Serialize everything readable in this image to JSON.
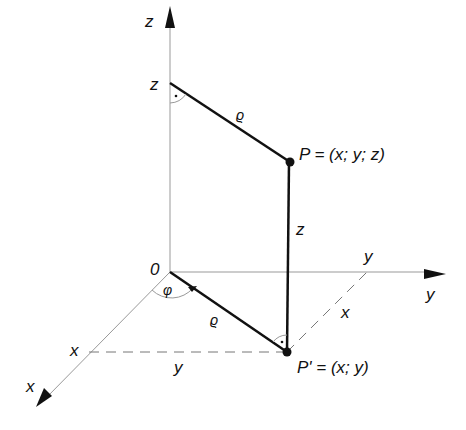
{
  "diagram": {
    "axes": {
      "z_label": "z",
      "y_label": "y",
      "x_label": "x"
    },
    "origin_label": "0",
    "points": {
      "P": "P = (x; y; z)",
      "P_prime": "P' = (x; y)"
    },
    "labels": {
      "z_on_axis": "z",
      "rho_top": "ϱ",
      "rho_bottom": "ϱ",
      "z_segment": "z",
      "y_on_axis": "y",
      "x_on_axis": "x",
      "x_segment": "x",
      "y_segment": "y",
      "phi": "φ",
      "right_angle_dot_top": "·",
      "right_angle_dot_bottom": "·"
    },
    "colors": {
      "axis": "#999999",
      "thick": "#111111",
      "dashed": "#777777"
    }
  }
}
